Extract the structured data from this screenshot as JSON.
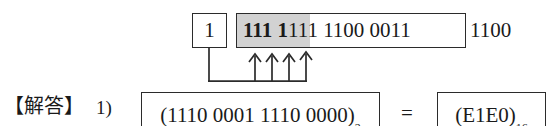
{
  "diagram": {
    "top_row": {
      "single_bit_box": {
        "value": "1"
      },
      "main_box": {
        "shaded_bits": "111 1",
        "unshaded_bits": "111 1100 0011"
      },
      "trailing_bits": "1100"
    },
    "arrow_count": 4,
    "arrow_icon_name": "up-arrow-icon",
    "connector_name": "carry-connector-line"
  },
  "answer_row": {
    "label": "【解答】",
    "item_number": "1)",
    "binary_answer": "(1110 0001 1110 0000)",
    "binary_subscript": "2",
    "equals": "=",
    "hex_answer": "(E1E0)",
    "hex_subscript": "16"
  },
  "colors": {
    "ink": "#1a1a1a",
    "stroke": "#2b2b2b",
    "shade": "#d2d2d2",
    "background": "#ffffff"
  }
}
